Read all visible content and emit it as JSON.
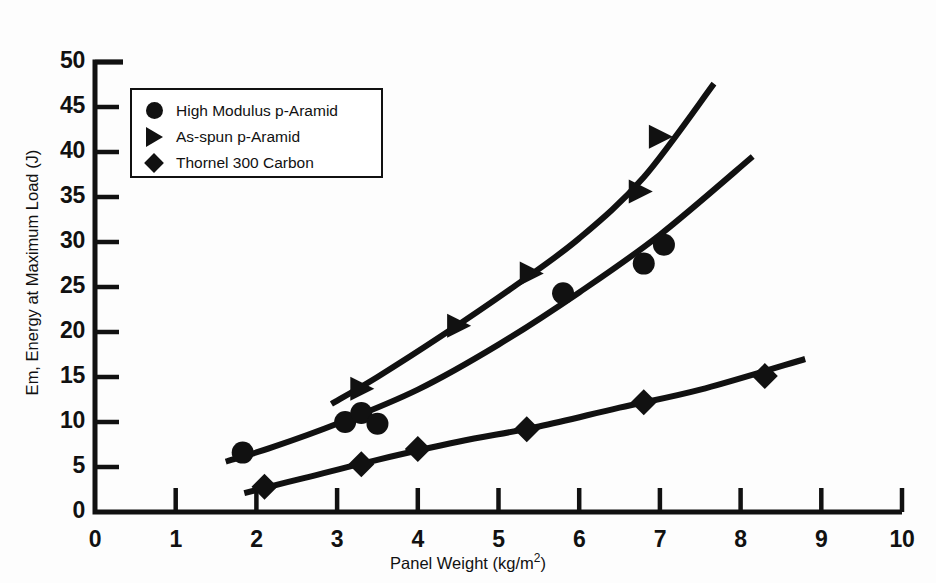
{
  "chart_data": {
    "type": "scatter",
    "title": "",
    "xlabel": "Panel Weight (kg/m2)",
    "ylabel": "Em, Energy at Maximum Load (J)",
    "xlim": [
      0,
      10
    ],
    "ylim": [
      0,
      50
    ],
    "xticks": [
      "0",
      "1",
      "2",
      "3",
      "4",
      "5",
      "6",
      "7",
      "8",
      "9",
      "10"
    ],
    "yticks": [
      "0",
      "5",
      "10",
      "15",
      "20",
      "25",
      "30",
      "35",
      "40",
      "45",
      "50"
    ],
    "grid": false,
    "legend_position": "upper-left-inside",
    "series": [
      {
        "name": "High Modulus p-Aramid",
        "marker": "circle",
        "points": [
          {
            "x": 1.83,
            "y": 6.6
          },
          {
            "x": 3.1,
            "y": 10.0
          },
          {
            "x": 3.3,
            "y": 11.0
          },
          {
            "x": 3.5,
            "y": 9.8
          },
          {
            "x": 5.8,
            "y": 24.3
          },
          {
            "x": 6.8,
            "y": 27.6
          },
          {
            "x": 7.05,
            "y": 29.7
          }
        ],
        "curve": [
          {
            "x": 1.62,
            "y": 5.6
          },
          {
            "x": 2.2,
            "y": 7.2
          },
          {
            "x": 3.0,
            "y": 9.8
          },
          {
            "x": 4.0,
            "y": 13.6
          },
          {
            "x": 5.0,
            "y": 18.6
          },
          {
            "x": 6.0,
            "y": 24.4
          },
          {
            "x": 7.0,
            "y": 30.8
          },
          {
            "x": 8.15,
            "y": 39.5
          }
        ]
      },
      {
        "name": "As-spun p-Aramid",
        "marker": "triangle",
        "points": [
          {
            "x": 3.3,
            "y": 13.7
          },
          {
            "x": 4.5,
            "y": 20.7
          },
          {
            "x": 5.4,
            "y": 26.5
          },
          {
            "x": 6.75,
            "y": 35.6
          },
          {
            "x": 7.0,
            "y": 41.7
          }
        ],
        "curve": [
          {
            "x": 2.93,
            "y": 12.0
          },
          {
            "x": 3.5,
            "y": 15.0
          },
          {
            "x": 4.3,
            "y": 19.6
          },
          {
            "x": 5.2,
            "y": 25.1
          },
          {
            "x": 6.0,
            "y": 30.4
          },
          {
            "x": 6.8,
            "y": 37.2
          },
          {
            "x": 7.67,
            "y": 47.6
          }
        ]
      },
      {
        "name": "Thornel 300 Carbon",
        "marker": "diamond",
        "points": [
          {
            "x": 2.1,
            "y": 2.8
          },
          {
            "x": 3.3,
            "y": 5.3
          },
          {
            "x": 4.0,
            "y": 7.0
          },
          {
            "x": 5.35,
            "y": 9.2
          },
          {
            "x": 6.8,
            "y": 12.2
          },
          {
            "x": 8.3,
            "y": 15.1
          }
        ],
        "curve": [
          {
            "x": 1.85,
            "y": 2.1
          },
          {
            "x": 2.6,
            "y": 3.8
          },
          {
            "x": 3.5,
            "y": 5.8
          },
          {
            "x": 4.5,
            "y": 7.8
          },
          {
            "x": 5.5,
            "y": 9.5
          },
          {
            "x": 6.5,
            "y": 11.6
          },
          {
            "x": 7.5,
            "y": 13.6
          },
          {
            "x": 8.8,
            "y": 17.0
          }
        ]
      }
    ],
    "colors": {
      "ink": "#111111",
      "background": "#fdfdfd"
    }
  },
  "axes": {
    "x_title_prefix": "Panel Weight (kg/m",
    "x_title_exponent": "2",
    "x_title_suffix": ")",
    "y_title": "Em, Energy at Maximum Load (J)"
  },
  "legend": {
    "items": [
      {
        "marker": "circle-marker",
        "label": "High Modulus p-Aramid"
      },
      {
        "marker": "triangle-marker",
        "label": "As-spun p-Aramid"
      },
      {
        "marker": "diamond-marker",
        "label": "Thornel 300 Carbon"
      }
    ]
  }
}
